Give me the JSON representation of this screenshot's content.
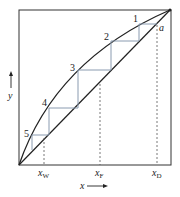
{
  "diagram": {
    "type": "McCabe-Thiele staircase",
    "axes": {
      "x_label": "x",
      "y_label": "y"
    },
    "stage_labels": [
      "1",
      "2",
      "3",
      "4",
      "5"
    ],
    "point_labels": {
      "a": "a"
    },
    "x_markers": [
      {
        "label": "x",
        "sub": "W"
      },
      {
        "label": "x",
        "sub": "F"
      },
      {
        "label": "x",
        "sub": "D"
      }
    ],
    "colors": {
      "curve": "#222222",
      "steps": "#8a9bb0",
      "dashed": "#555555",
      "frame": "#333333"
    }
  }
}
